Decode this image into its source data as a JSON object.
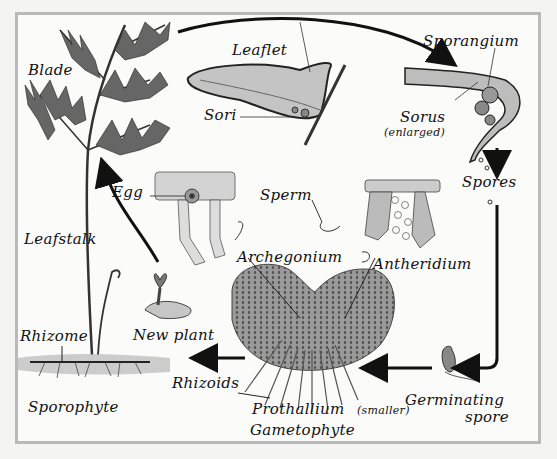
{
  "diagram": {
    "colors": {
      "background": "#fbfbfa",
      "frame": "#b9b9b9",
      "ink": "#111111",
      "tissue": "#8a8a8a"
    },
    "labels": {
      "blade": "Blade",
      "leaflet": "Leaflet",
      "sori": "Sori",
      "sporangium": "Sporangium",
      "sorus": "Sorus",
      "sorus_note": "(enlarged)",
      "spores": "Spores",
      "egg": "Egg",
      "sperm": "Sperm",
      "archegonium": "Archegonium",
      "antheridium": "Antheridium",
      "leafstalk": "Leafstalk",
      "new_plant": "New plant",
      "rhizome": "Rhizome",
      "rhizoids": "Rhizoids",
      "sporophyte": "Sporophyte",
      "prothallium": "Prothallium",
      "prothallium_note": "(smaller)",
      "gametophyte": "Gametophyte",
      "germinating": "Germinating",
      "spore": "spore"
    },
    "cycle_order": [
      "Sporophyte",
      "Leaflet",
      "Sorus",
      "Sporangium",
      "Spores",
      "Germinating spore",
      "Prothallium (Gametophyte)",
      "Archegonium / Antheridium",
      "Egg + Sperm",
      "New plant",
      "Sporophyte"
    ]
  }
}
